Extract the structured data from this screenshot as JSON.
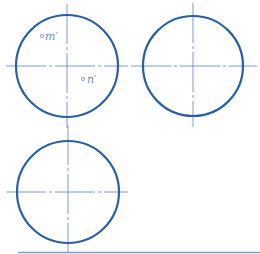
{
  "diagram": {
    "type": "orthographic-projection-exercise",
    "colors": {
      "outline": "#2a5fa8",
      "centerline": "#6b8fcf",
      "label": "#6f8fc4",
      "bottom_rule": "#7d9bd2"
    },
    "views": [
      {
        "id": "view-top-left",
        "cx": 67,
        "cy": 66,
        "r": 51
      },
      {
        "id": "view-top-right",
        "cx": 193,
        "cy": 66,
        "r": 50
      },
      {
        "id": "view-bottom-left",
        "cx": 68,
        "cy": 192,
        "r": 51
      }
    ],
    "points": [
      {
        "label": "m′",
        "x": 42,
        "y": 37
      },
      {
        "label": "n′",
        "x": 82,
        "y": 79
      }
    ]
  }
}
